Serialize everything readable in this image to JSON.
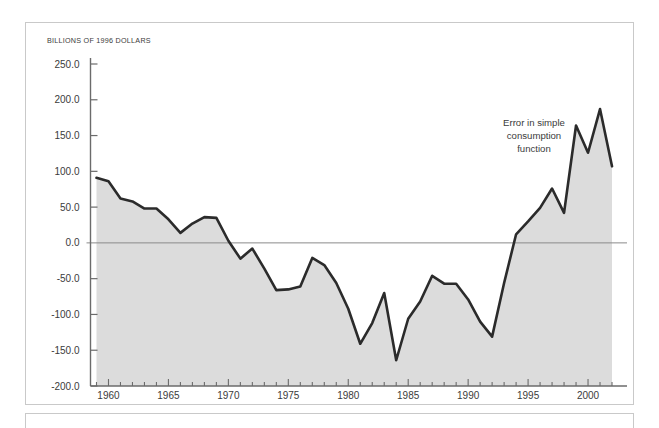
{
  "figure": {
    "unit_label": "BILLIONS OF 1996 DOLLARS",
    "annotation": {
      "line1": "Error in simple",
      "line2": "consumption",
      "line3": "function"
    },
    "colors": {
      "line": "#2b2b2b",
      "fill": "#dcdcdc",
      "axis": "#6b6b6b",
      "zero_line": "#8a8a8a",
      "frame": "#c9c9c9",
      "text": "#3b3b3b",
      "background": "#ffffff"
    }
  },
  "chart_data": {
    "type": "area",
    "title": "",
    "subtitle": "",
    "xlabel": "",
    "ylabel": "BILLIONS OF 1996 DOLLARS",
    "xlim": [
      1958.5,
      2002.5
    ],
    "ylim": [
      -200.0,
      250.0
    ],
    "grid": false,
    "legend_position": "none",
    "zero_line": 0.0,
    "ytick_labels": [
      "250.0",
      "200.0",
      "150.0",
      "100.0",
      "50.0",
      "0.0",
      "-50.0",
      "-100.0",
      "-150.0",
      "-200.0"
    ],
    "yticks": [
      250,
      200,
      150,
      100,
      50,
      0,
      -50,
      -100,
      -150,
      -200
    ],
    "xtick_labels": [
      "1960",
      "1965",
      "1970",
      "1975",
      "1980",
      "1985",
      "1990",
      "1995",
      "2000"
    ],
    "xticks": [
      1960,
      1965,
      1970,
      1975,
      1980,
      1985,
      1990,
      1995,
      2000
    ],
    "x_minor_tick_step": 1,
    "series": [
      {
        "name": "Error in simple consumption function",
        "x": [
          1959,
          1960,
          1961,
          1962,
          1963,
          1964,
          1965,
          1966,
          1967,
          1968,
          1969,
          1970,
          1971,
          1972,
          1973,
          1974,
          1975,
          1976,
          1977,
          1978,
          1979,
          1980,
          1981,
          1982,
          1983,
          1984,
          1985,
          1986,
          1987,
          1988,
          1989,
          1990,
          1991,
          1992,
          1993,
          1994,
          1995,
          1996,
          1997,
          1998,
          1999,
          2000,
          2001,
          2002
        ],
        "values": [
          91,
          86,
          62,
          58,
          48,
          48,
          33,
          14,
          27,
          36,
          35,
          3,
          -22,
          -8,
          -36,
          -66,
          -65,
          -61,
          -21,
          -31,
          -56,
          -92,
          -141,
          -112,
          -70,
          -164,
          -106,
          -82,
          -46,
          -57,
          -57,
          -79,
          -110,
          -131,
          -56,
          12,
          30,
          49,
          76,
          42,
          164,
          126,
          187,
          107
        ]
      }
    ],
    "annotations": [
      {
        "text": "Error in simple consumption function",
        "x": 1999,
        "y": 150
      }
    ]
  }
}
